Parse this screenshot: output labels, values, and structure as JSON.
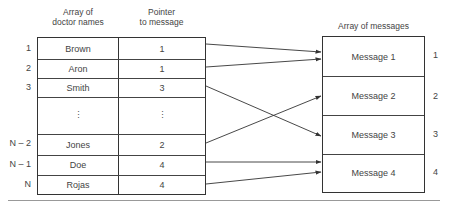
{
  "left_table": {
    "header_names": "Array of\ndoctor names",
    "header_names_line1": "Array of",
    "header_names_line2": "doctor names",
    "header_pointer_line1": "Pointer",
    "header_pointer_line2": "to message",
    "rows": [
      {
        "index": "1",
        "name": "Brown",
        "pointer": "1"
      },
      {
        "index": "2",
        "name": "Aron",
        "pointer": "1"
      },
      {
        "index": "3",
        "name": "Smith",
        "pointer": "3"
      },
      {
        "index": "",
        "name": "⋮",
        "pointer": "⋮"
      },
      {
        "index": "N – 2",
        "name": "Jones",
        "pointer": "2"
      },
      {
        "index": "N – 1",
        "name": "Doe",
        "pointer": "4"
      },
      {
        "index": "N",
        "name": "Rojas",
        "pointer": "4"
      }
    ]
  },
  "right_table": {
    "header": "Array of messages",
    "rows": [
      {
        "index": "1",
        "label": "Message 1"
      },
      {
        "index": "2",
        "label": "Message 2"
      },
      {
        "index": "3",
        "label": "Message 3"
      },
      {
        "index": "4",
        "label": "Message 4"
      }
    ]
  },
  "arrows": [
    {
      "from": "Brown",
      "to": "Message 1"
    },
    {
      "from": "Aron",
      "to": "Message 1"
    },
    {
      "from": "Smith",
      "to": "Message 3"
    },
    {
      "from": "Jones",
      "to": "Message 2"
    },
    {
      "from": "Doe",
      "to": "Message 4"
    },
    {
      "from": "Rojas",
      "to": "Message 4"
    }
  ]
}
